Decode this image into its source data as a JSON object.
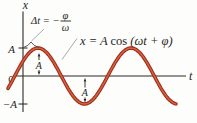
{
  "figure": {
    "background": "#fdfdfb",
    "axis_color": "#2b2b2b",
    "text_color": "#1f1f1f",
    "curve_color_outer": "#9e2b1c",
    "curve_color_inner": "#d4603c",
    "leader_color": "#a2adb3",
    "labels": {
      "x_axis": "x",
      "t_axis": "t",
      "origin": "0",
      "amp_pos": "A",
      "amp_neg": "−A",
      "peak_arrow": "A",
      "trough_arrow": "A"
    },
    "annotations": {
      "phase_lhs": "Δt = −",
      "phase_numerator": "φ",
      "phase_denominator": "ω",
      "eq_lhs": "x = A ",
      "eq_func": "cos ",
      "eq_arg": "(ωt + φ)"
    }
  },
  "chart_data": {
    "type": "line",
    "title": "",
    "xlabel": "t",
    "ylabel": "x",
    "x_tick_labels": [],
    "y_tick_labels": [
      "A",
      "0",
      "−A"
    ],
    "grid": false,
    "legend": false,
    "series": [
      {
        "name": "x(t)",
        "equation": "x = A cos (ωt + φ)",
        "amplitude": "A",
        "angular_frequency": "ω",
        "phase_constant": "φ",
        "time_offset_of_first_peak": "Δt = −φ/ω",
        "shape": "cosine shifted right by −φ/ω, starting below zero at far left, first peak just after t = 0, then trough, then second peak"
      }
    ],
    "annotations": [
      "Δt = −φ/ω",
      "x = A cos (ωt + φ)"
    ],
    "geometry_px": {
      "axis_y": 76,
      "amplitude": 28,
      "first_peak_x": 38,
      "period": 93,
      "x_start": 8,
      "x_end": 176
    }
  }
}
